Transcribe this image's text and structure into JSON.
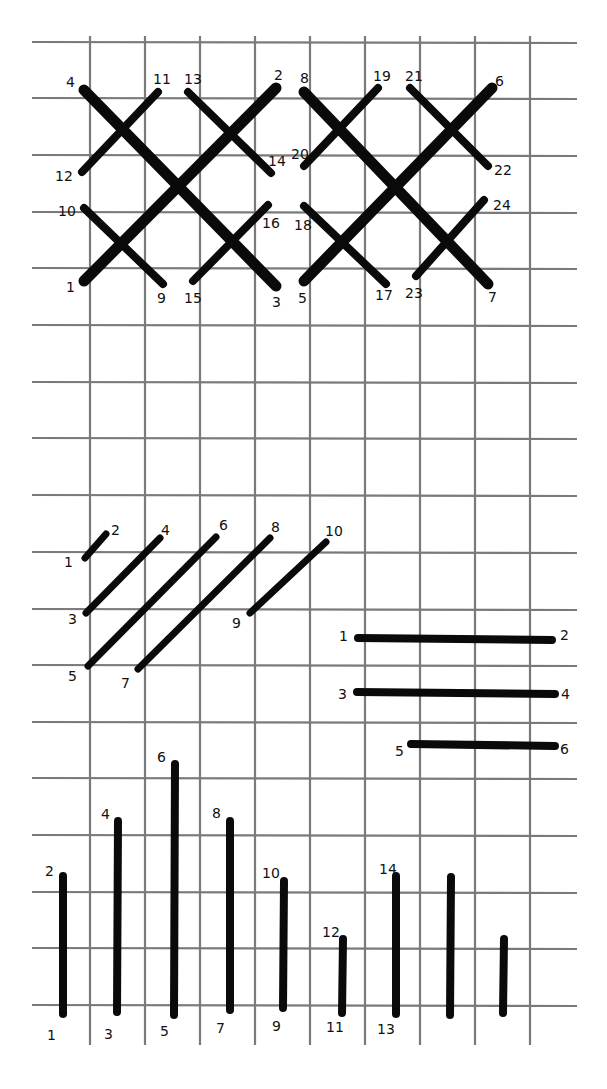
{
  "diagram": {
    "title": "",
    "grid": {
      "x_lines": [
        90,
        145,
        200,
        255,
        310,
        365,
        420,
        475,
        530
      ],
      "y_lines": [
        42,
        98,
        155,
        212,
        268,
        325,
        382,
        438,
        495,
        552,
        609,
        665,
        722,
        778,
        835,
        892,
        948,
        1005
      ],
      "x_start": 32,
      "x_end": 577,
      "y_start": 36,
      "y_end": 1045,
      "color": "#7a7a7a"
    },
    "stitch_color": "#0a0a0a",
    "sections": [
      {
        "name": "large-cross-stitch-pattern",
        "stitches": [
          {
            "from": [
              84,
              281
            ],
            "to": [
              276,
              88
            ],
            "width": 11
          },
          {
            "from": [
              84,
              90
            ],
            "to": [
              276,
              286
            ],
            "width": 11
          },
          {
            "from": [
              304,
              281
            ],
            "to": [
              492,
              88
            ],
            "width": 11
          },
          {
            "from": [
              304,
              92
            ],
            "to": [
              488,
              284
            ],
            "width": 11
          },
          {
            "from": [
              82,
              172
            ],
            "to": [
              158,
              92
            ],
            "width": 8
          },
          {
            "from": [
              188,
              92
            ],
            "to": [
              271,
              173
            ],
            "width": 8
          },
          {
            "from": [
              84,
              208
            ],
            "to": [
              163,
              284
            ],
            "width": 8
          },
          {
            "from": [
              193,
              281
            ],
            "to": [
              268,
              205
            ],
            "width": 8
          },
          {
            "from": [
              304,
              166
            ],
            "to": [
              378,
              88
            ],
            "width": 8
          },
          {
            "from": [
              410,
              88
            ],
            "to": [
              488,
              166
            ],
            "width": 8
          },
          {
            "from": [
              304,
              206
            ],
            "to": [
              386,
              284
            ],
            "width": 8
          },
          {
            "from": [
              416,
              276
            ],
            "to": [
              484,
              200
            ],
            "width": 8
          }
        ],
        "labels": [
          {
            "text": "4",
            "x": 66,
            "y": 87
          },
          {
            "text": "11",
            "x": 153,
            "y": 84
          },
          {
            "text": "13",
            "x": 184,
            "y": 84
          },
          {
            "text": "2",
            "x": 274,
            "y": 80
          },
          {
            "text": "8",
            "x": 300,
            "y": 83
          },
          {
            "text": "19",
            "x": 373,
            "y": 81
          },
          {
            "text": "21",
            "x": 405,
            "y": 81
          },
          {
            "text": "6",
            "x": 495,
            "y": 86
          },
          {
            "text": "12",
            "x": 55,
            "y": 181
          },
          {
            "text": "14",
            "x": 268,
            "y": 166
          },
          {
            "text": "20",
            "x": 291,
            "y": 159
          },
          {
            "text": "22",
            "x": 494,
            "y": 175
          },
          {
            "text": "10",
            "x": 58,
            "y": 216
          },
          {
            "text": "16",
            "x": 262,
            "y": 228
          },
          {
            "text": "18",
            "x": 294,
            "y": 230
          },
          {
            "text": "24",
            "x": 493,
            "y": 210
          },
          {
            "text": "1",
            "x": 66,
            "y": 292
          },
          {
            "text": "9",
            "x": 157,
            "y": 303
          },
          {
            "text": "15",
            "x": 184,
            "y": 303
          },
          {
            "text": "3",
            "x": 272,
            "y": 307
          },
          {
            "text": "5",
            "x": 298,
            "y": 303
          },
          {
            "text": "17",
            "x": 375,
            "y": 300
          },
          {
            "text": "23",
            "x": 405,
            "y": 298
          },
          {
            "text": "7",
            "x": 488,
            "y": 302
          }
        ]
      },
      {
        "name": "diagonal-stitch-sequence",
        "stitches": [
          {
            "from": [
              85,
              558
            ],
            "to": [
              106,
              534
            ],
            "width": 7
          },
          {
            "from": [
              86,
              613
            ],
            "to": [
              160,
              538
            ],
            "width": 7
          },
          {
            "from": [
              88,
              666
            ],
            "to": [
              216,
              537
            ],
            "width": 7
          },
          {
            "from": [
              138,
              669
            ],
            "to": [
              270,
              538
            ],
            "width": 7
          },
          {
            "from": [
              250,
              613
            ],
            "to": [
              326,
              542
            ],
            "width": 7
          }
        ],
        "labels": [
          {
            "text": "1",
            "x": 64,
            "y": 567
          },
          {
            "text": "2",
            "x": 111,
            "y": 535
          },
          {
            "text": "3",
            "x": 68,
            "y": 624
          },
          {
            "text": "4",
            "x": 161,
            "y": 535
          },
          {
            "text": "5",
            "x": 68,
            "y": 681
          },
          {
            "text": "6",
            "x": 219,
            "y": 530
          },
          {
            "text": "7",
            "x": 121,
            "y": 688
          },
          {
            "text": "8",
            "x": 271,
            "y": 532
          },
          {
            "text": "9",
            "x": 232,
            "y": 628
          },
          {
            "text": "10",
            "x": 325,
            "y": 536
          }
        ]
      },
      {
        "name": "horizontal-stitch-sequence",
        "stitches": [
          {
            "from": [
              358,
              638
            ],
            "to": [
              552,
              640
            ],
            "width": 8
          },
          {
            "from": [
              357,
              692
            ],
            "to": [
              555,
              694
            ],
            "width": 8
          },
          {
            "from": [
              411,
              744
            ],
            "to": [
              555,
              746
            ],
            "width": 8
          }
        ],
        "labels": [
          {
            "text": "1",
            "x": 339,
            "y": 641
          },
          {
            "text": "2",
            "x": 560,
            "y": 640
          },
          {
            "text": "3",
            "x": 338,
            "y": 699
          },
          {
            "text": "4",
            "x": 561,
            "y": 699
          },
          {
            "text": "5",
            "x": 395,
            "y": 756
          },
          {
            "text": "6",
            "x": 560,
            "y": 754
          }
        ]
      },
      {
        "name": "vertical-stitch-sequence",
        "stitches": [
          {
            "from": [
              63,
              876
            ],
            "to": [
              63,
              1014
            ],
            "width": 8
          },
          {
            "from": [
              118,
              821
            ],
            "to": [
              117,
              1012
            ],
            "width": 8
          },
          {
            "from": [
              175,
              764
            ],
            "to": [
              174,
              1015
            ],
            "width": 8
          },
          {
            "from": [
              230,
              821
            ],
            "to": [
              230,
              1010
            ],
            "width": 8
          },
          {
            "from": [
              284,
              881
            ],
            "to": [
              283,
              1008
            ],
            "width": 8
          },
          {
            "from": [
              343,
              939
            ],
            "to": [
              342,
              1013
            ],
            "width": 8
          },
          {
            "from": [
              396,
              876
            ],
            "to": [
              396,
              1014
            ],
            "width": 8
          },
          {
            "from": [
              451,
              877
            ],
            "to": [
              450,
              1015
            ],
            "width": 8
          },
          {
            "from": [
              504,
              939
            ],
            "to": [
              503,
              1013
            ],
            "width": 8
          }
        ],
        "labels": [
          {
            "text": "2",
            "x": 45,
            "y": 876
          },
          {
            "text": "4",
            "x": 101,
            "y": 819
          },
          {
            "text": "6",
            "x": 157,
            "y": 762
          },
          {
            "text": "8",
            "x": 212,
            "y": 818
          },
          {
            "text": "10",
            "x": 262,
            "y": 878
          },
          {
            "text": "12",
            "x": 322,
            "y": 937
          },
          {
            "text": "14",
            "x": 379,
            "y": 874
          },
          {
            "text": "1",
            "x": 47,
            "y": 1040
          },
          {
            "text": "3",
            "x": 104,
            "y": 1039
          },
          {
            "text": "5",
            "x": 160,
            "y": 1036
          },
          {
            "text": "7",
            "x": 216,
            "y": 1033
          },
          {
            "text": "9",
            "x": 272,
            "y": 1031
          },
          {
            "text": "11",
            "x": 326,
            "y": 1032
          },
          {
            "text": "13",
            "x": 377,
            "y": 1034
          }
        ]
      }
    ]
  }
}
